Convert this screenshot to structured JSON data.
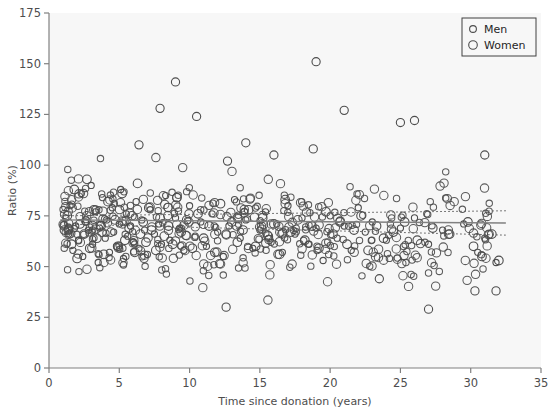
{
  "figure": {
    "background_color": "#ffffff",
    "panel_color": "#f7f7f7",
    "axis_color": "#808080",
    "text_color": "#4d4d4d",
    "marker_color": "#4d4d4d",
    "fit_line_color": "#808080",
    "ci_line_color": "#595959"
  },
  "legend": {
    "position": "top-right",
    "border_color": "#404040",
    "entries": [
      {
        "label": "Men",
        "marker": "open-circle",
        "size": "small"
      },
      {
        "label": "Women",
        "marker": "open-circle",
        "size": "large"
      }
    ]
  },
  "chart_data": {
    "type": "scatter",
    "title": "",
    "xlabel": "Time since donation (years)",
    "ylabel": "Ratio (%)",
    "xlim": [
      0,
      35
    ],
    "ylim": [
      0,
      175
    ],
    "xticks": [
      0,
      5,
      10,
      15,
      20,
      25,
      30,
      35
    ],
    "yticks": [
      0,
      25,
      50,
      75,
      100,
      125,
      150,
      175
    ],
    "grid": false,
    "legend_position": "top-right",
    "series": [
      {
        "name": "Men",
        "marker": "open-circle",
        "marker_size": 5,
        "points": [
          [
            1.2,
            74
          ],
          [
            1.4,
            66
          ],
          [
            1.5,
            80
          ],
          [
            1.7,
            58
          ],
          [
            1.9,
            70
          ],
          [
            2.1,
            63
          ],
          [
            2.3,
            86
          ],
          [
            2.4,
            55
          ],
          [
            2.6,
            72
          ],
          [
            2.8,
            68
          ],
          [
            3.0,
            90
          ],
          [
            3.1,
            61
          ],
          [
            3.3,
            77
          ],
          [
            3.5,
            52
          ],
          [
            3.6,
            69
          ],
          [
            3.8,
            84
          ],
          [
            4.0,
            64
          ],
          [
            4.1,
            73
          ],
          [
            4.3,
            57
          ],
          [
            4.5,
            79
          ],
          [
            4.6,
            67
          ],
          [
            4.8,
            60
          ],
          [
            5.0,
            71
          ],
          [
            5.1,
            88
          ],
          [
            5.3,
            54
          ],
          [
            5.5,
            76
          ],
          [
            5.6,
            65
          ],
          [
            5.8,
            70
          ],
          [
            6.0,
            62
          ],
          [
            6.2,
            82
          ],
          [
            6.4,
            59
          ],
          [
            6.6,
            73
          ],
          [
            6.8,
            68
          ],
          [
            7.0,
            56
          ],
          [
            7.2,
            78
          ],
          [
            7.5,
            66
          ],
          [
            7.8,
            71
          ],
          [
            8.0,
            61
          ],
          [
            8.3,
            85
          ],
          [
            8.6,
            63
          ],
          [
            9.0,
            74
          ],
          [
            9.3,
            69
          ],
          [
            9.6,
            58
          ],
          [
            10.0,
            80
          ],
          [
            10.4,
            65
          ],
          [
            10.8,
            72
          ],
          [
            11.2,
            60
          ],
          [
            11.6,
            76
          ],
          [
            12.0,
            67
          ],
          [
            12.4,
            55
          ],
          [
            12.8,
            70
          ],
          [
            13.2,
            83
          ],
          [
            13.6,
            64
          ],
          [
            14.0,
            73
          ],
          [
            14.5,
            59
          ],
          [
            15.0,
            68
          ],
          [
            15.4,
            77
          ],
          [
            15.8,
            62
          ],
          [
            16.2,
            71
          ],
          [
            16.6,
            57
          ],
          [
            17.0,
            80
          ],
          [
            17.5,
            66
          ],
          [
            18.0,
            74
          ],
          [
            18.5,
            61
          ],
          [
            19.0,
            69
          ],
          [
            19.5,
            53
          ],
          [
            20.0,
            75
          ],
          [
            20.5,
            64
          ],
          [
            21.0,
            70
          ],
          [
            21.5,
            58
          ],
          [
            22.0,
            79
          ],
          [
            22.5,
            67
          ],
          [
            23.0,
            72
          ],
          [
            24.0,
            63
          ],
          [
            25.0,
            69
          ],
          [
            26.0,
            74
          ],
          [
            27.0,
            61
          ],
          [
            28.0,
            68
          ],
          [
            29.5,
            71
          ],
          [
            30.5,
            57
          ],
          [
            31.0,
            64
          ],
          [
            31.8,
            52
          ]
        ]
      },
      {
        "name": "Women",
        "marker": "open-circle",
        "marker_size": 7,
        "points": [
          [
            1.1,
            68
          ],
          [
            1.3,
            75
          ],
          [
            1.6,
            61
          ],
          [
            1.8,
            88
          ],
          [
            2.0,
            54
          ],
          [
            2.2,
            71
          ],
          [
            2.5,
            66
          ],
          [
            2.7,
            93
          ],
          [
            2.9,
            59
          ],
          [
            3.2,
            78
          ],
          [
            3.4,
            64
          ],
          [
            3.7,
            70
          ],
          [
            3.9,
            56
          ],
          [
            4.2,
            82
          ],
          [
            4.4,
            67
          ],
          [
            4.7,
            73
          ],
          [
            4.9,
            60
          ],
          [
            5.2,
            86
          ],
          [
            5.4,
            63
          ],
          [
            5.7,
            69
          ],
          [
            5.9,
            75
          ],
          [
            6.1,
            57
          ],
          [
            6.3,
            91
          ],
          [
            6.5,
            66
          ],
          [
            6.7,
            72
          ],
          [
            6.9,
            62
          ],
          [
            7.1,
            79
          ],
          [
            7.3,
            68
          ],
          [
            7.6,
            58
          ],
          [
            7.9,
            74
          ],
          [
            8.2,
            65
          ],
          [
            8.5,
            70
          ],
          [
            8.8,
            61
          ],
          [
            9.1,
            84
          ],
          [
            9.4,
            67
          ],
          [
            9.8,
            73
          ],
          [
            10.2,
            59
          ],
          [
            10.6,
            76
          ],
          [
            11.0,
            64
          ],
          [
            11.4,
            70
          ],
          [
            11.8,
            57
          ],
          [
            12.2,
            81
          ],
          [
            12.6,
            66
          ],
          [
            13.0,
            72
          ],
          [
            13.4,
            62
          ],
          [
            13.8,
            68
          ],
          [
            14.2,
            78
          ],
          [
            14.7,
            60
          ],
          [
            15.2,
            74
          ],
          [
            15.6,
            65
          ],
          [
            16.0,
            71
          ],
          [
            16.4,
            56
          ],
          [
            16.8,
            83
          ],
          [
            17.2,
            67
          ],
          [
            17.7,
            73
          ],
          [
            18.2,
            63
          ],
          [
            18.7,
            70
          ],
          [
            19.2,
            59
          ],
          [
            19.7,
            77
          ],
          [
            20.2,
            66
          ],
          [
            20.7,
            72
          ],
          [
            21.2,
            61
          ],
          [
            21.7,
            68
          ],
          [
            22.2,
            75
          ],
          [
            22.7,
            58
          ],
          [
            23.3,
            70
          ],
          [
            23.8,
            64
          ],
          [
            24.5,
            67
          ],
          [
            25.3,
            72
          ],
          [
            26.2,
            63
          ],
          [
            27.3,
            69
          ],
          [
            28.5,
            66
          ],
          [
            29.8,
            72
          ],
          [
            30.2,
            60
          ],
          [
            30.8,
            55
          ],
          [
            31.5,
            66
          ],
          [
            32.0,
            53
          ]
        ]
      }
    ],
    "high_outliers": [
      [
        9.0,
        141
      ],
      [
        19.0,
        151
      ],
      [
        7.9,
        128
      ],
      [
        21.0,
        127
      ],
      [
        10.5,
        124
      ],
      [
        25.0,
        121
      ],
      [
        26.0,
        122
      ],
      [
        6.4,
        110
      ],
      [
        14.0,
        111
      ],
      [
        18.8,
        108
      ],
      [
        16.0,
        105
      ],
      [
        31.0,
        105
      ],
      [
        12.7,
        102
      ]
    ],
    "low_outliers": [
      [
        12.6,
        30
      ],
      [
        27.0,
        29
      ],
      [
        30.3,
        38
      ],
      [
        31.8,
        38
      ],
      [
        23.5,
        44
      ]
    ],
    "fit_line": {
      "style": "solid",
      "x_start": 0.8,
      "x_end": 32.5,
      "y_start": 73.0,
      "y_end": 71.5
    },
    "ci_upper": {
      "style": "dotted",
      "x_start": 0.8,
      "x_end": 32.5,
      "y_start": 75.0,
      "y_end": 77.5
    },
    "ci_lower": {
      "style": "dotted",
      "x_start": 0.8,
      "x_end": 32.5,
      "y_start": 71.0,
      "y_end": 65.5
    }
  }
}
